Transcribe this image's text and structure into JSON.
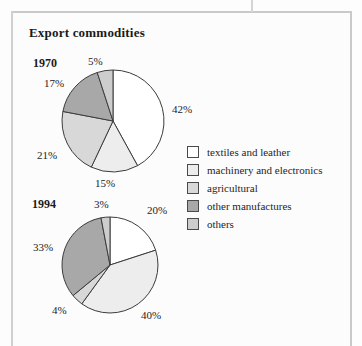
{
  "document": {
    "title": "Export commodities"
  },
  "legend": {
    "items": [
      {
        "label": "textiles and leather",
        "color": "#ffffff",
        "key": "textiles"
      },
      {
        "label": "machinery and electronics",
        "color": "#ededed",
        "key": "machinery"
      },
      {
        "label": "agricultural",
        "color": "#d8d8d8",
        "key": "agricultural"
      },
      {
        "label": "other manufactures",
        "color": "#a8a8a8",
        "key": "other_manufactures"
      },
      {
        "label": "others",
        "color": "#cdcdcd",
        "key": "others"
      }
    ]
  },
  "chart_data": [
    {
      "type": "pie",
      "title": "1970",
      "categories": [
        "textiles and leather",
        "machinery and electronics",
        "agricultural",
        "other manufactures",
        "others"
      ],
      "values": [
        42,
        15,
        21,
        17,
        5
      ],
      "value_labels": [
        "42%",
        "15%",
        "21%",
        "17%",
        "5%"
      ],
      "colors": [
        "#ffffff",
        "#ededed",
        "#d8d8d8",
        "#a8a8a8",
        "#cdcdcd"
      ],
      "start_angle_deg": 0,
      "direction": "clockwise",
      "center": [
        113,
        121
      ],
      "radius": 51,
      "label_positions": [
        [
          172,
          103
        ],
        [
          95,
          177
        ],
        [
          37,
          149
        ],
        [
          44,
          77
        ],
        [
          88,
          55
        ]
      ]
    },
    {
      "type": "pie",
      "title": "1994",
      "categories": [
        "textiles and leather",
        "machinery and electronics",
        "agricultural",
        "other manufactures",
        "others"
      ],
      "values": [
        20,
        40,
        4,
        33,
        3
      ],
      "value_labels": [
        "20%",
        "40%",
        "4%",
        "33%",
        "3%"
      ],
      "colors": [
        "#ffffff",
        "#ededed",
        "#d8d8d8",
        "#a8a8a8",
        "#cdcdcd"
      ],
      "start_angle_deg": 0,
      "direction": "clockwise",
      "center": [
        110,
        265
      ],
      "radius": 48,
      "label_positions": [
        [
          147,
          204
        ],
        [
          141,
          309
        ],
        [
          52,
          304
        ],
        [
          33,
          241
        ],
        [
          94,
          198
        ]
      ]
    }
  ]
}
